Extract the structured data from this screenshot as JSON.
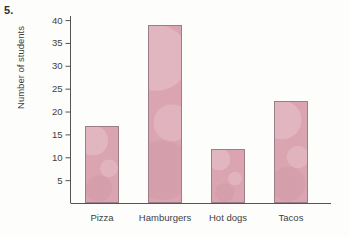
{
  "figure": {
    "problem_number": "5.",
    "background_color": "#fdfdfc"
  },
  "chart_data": {
    "type": "bar",
    "title": "",
    "xlabel": "",
    "ylabel": "Number of students",
    "categories": [
      "Pizza",
      "Hamburgers",
      "Hot dogs",
      "Tacos"
    ],
    "values": [
      17,
      39,
      12,
      22.5
    ],
    "ylim": [
      0,
      41
    ],
    "yticks": [
      5,
      10,
      15,
      20,
      25,
      30,
      35,
      40
    ],
    "ytick_labels": [
      "5",
      "10",
      "15",
      "20",
      "25",
      "30",
      "35",
      "40"
    ],
    "grid": false,
    "legend": false,
    "bar_fill_color": "#dba4b1",
    "bar_border_color": "#9d7d87",
    "axis_color": "#555555"
  }
}
